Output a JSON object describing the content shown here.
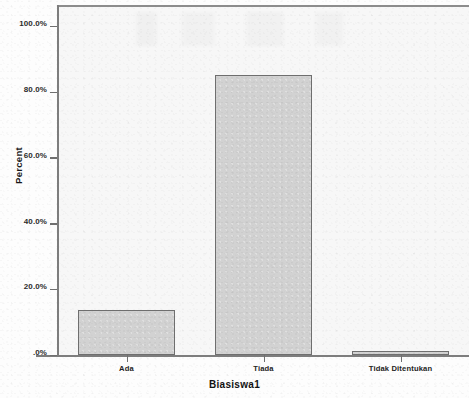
{
  "chart_data": {
    "type": "bar",
    "title": "",
    "subtitle": "",
    "xlabel": "Biasiswa1",
    "ylabel": "Percent",
    "categories": [
      "Ada",
      "Tiada",
      "Tidak Ditentukan"
    ],
    "values": [
      13.7,
      85.2,
      1.1
    ],
    "series": [
      {
        "name": "Percent",
        "values": [
          13.7,
          85.2,
          1.1
        ]
      }
    ],
    "ylim": [
      0,
      106.5
    ],
    "ytick_values": [
      0,
      20,
      40,
      60,
      80,
      100
    ],
    "ytick_labels": [
      ".0%",
      "20.0%",
      "40.0%",
      "60.0%",
      "80.0%",
      "100.0%"
    ],
    "grid": false,
    "legend": null,
    "legend_position": "none",
    "annotations": [],
    "colors": {
      "bar_fill": "#d2d2d2",
      "bar_border": "#6e6e6e",
      "plot_background": "#f7f7f7",
      "page_background": "#fdfdfd",
      "axis_line": "#7d7d7d",
      "text": "#1a1a1a"
    }
  }
}
